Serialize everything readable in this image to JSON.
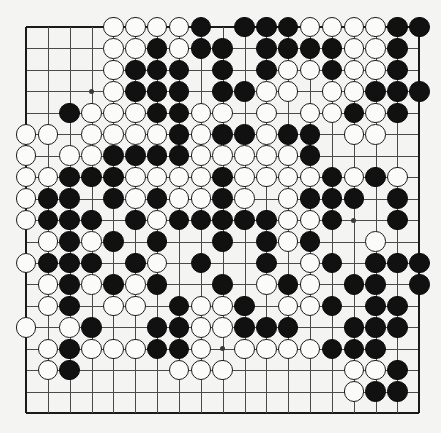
{
  "board": {
    "name": "go-board",
    "size": 19,
    "geometry": {
      "origin_x": 26,
      "origin_y": 27,
      "step_x": 21.85,
      "step_y": 21.45,
      "stone_diameter": 20.5
    },
    "colors": {
      "background": "#f4f4f2",
      "grid_line": "#4a4a4a",
      "edge_line": "#1a1a1a",
      "black_stone": "#111111",
      "white_stone": "#fbfbf9",
      "white_stone_border": "#1c1c1c",
      "hoshi": "#3a3a3a"
    },
    "hoshi_points": [
      [
        3,
        3
      ],
      [
        9,
        3
      ],
      [
        15,
        3
      ],
      [
        3,
        9
      ],
      [
        9,
        9
      ],
      [
        15,
        9
      ],
      [
        3,
        15
      ],
      [
        9,
        15
      ],
      [
        15,
        15
      ]
    ],
    "legend": {
      "empty": ".",
      "black": "B",
      "white": "W"
    },
    "rows": [
      "....WWWWB.BBBWWWWBB",
      "....WWBWBB.BBBBWWB.",
      "....WBBB.B.BWWBWWB.",
      "....WBBB.BBWW.WWBBB",
      "..BWWWBBWW.W.WWBWB.",
      "WW.WWWWBWBBWBB.WW..",
      "W.WWBBBBWWWWWB.....",
      "WWBBBWWWWBWWWWBWBW.",
      "WBB.BWBWWBW.WBBB.B.",
      "WBBB.BWBBBBBWWB..B.",
      ".WBWB.B..B.BWB..W..",
      "WBBB.BW.B..B.WB.BBB",
      ".WBWBWB..B.WBW.BB.B",
      ".WB.WW.BWWB.WWB.BB.",
      "W.WB..BBWWBBB..BBB.",
      ".WBWWWBBW.WWWWBBB..",
      ".WB....WWW.....WWB.",
      "...............WBB.",
      "..................."
    ]
  }
}
